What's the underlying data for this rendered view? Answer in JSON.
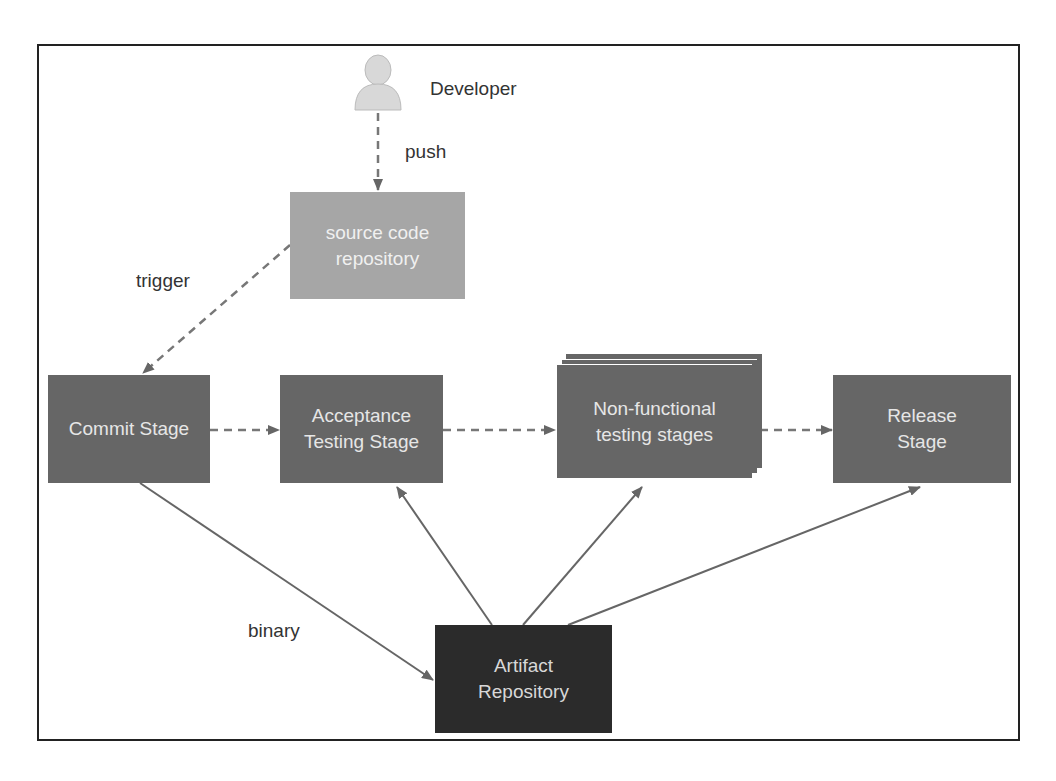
{
  "actor": {
    "label": "Developer",
    "icon": "user-icon"
  },
  "edges": {
    "push": "push",
    "trigger": "trigger",
    "binary": "binary"
  },
  "nodes": {
    "source": {
      "line1": "source code",
      "line2": "repository"
    },
    "commit": {
      "line1": "Commit Stage"
    },
    "acceptance": {
      "line1": "Acceptance",
      "line2": "Testing Stage"
    },
    "nonfunctional": {
      "line1": "Non-functional",
      "line2": "testing stages"
    },
    "release": {
      "line1": "Release",
      "line2": "Stage"
    },
    "artifact": {
      "line1": "Artifact",
      "line2": "Repository"
    }
  },
  "colors": {
    "stage": "#666666",
    "source": "#a6a6a6",
    "artifact": "#2b2b2b",
    "arrow": "#666666"
  }
}
